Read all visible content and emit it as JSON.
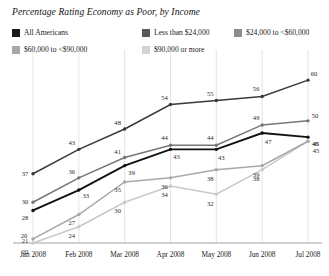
{
  "chart_data": {
    "type": "line",
    "title": "Percentage Rating Economy as Poor, by Income",
    "xlabel": "",
    "ylabel": "",
    "grid": "vertical-only",
    "legend_position": "top",
    "categories": [
      "Jan 2008",
      "Feb 2008",
      "Mar 2008",
      "Apr 2008",
      "May 2008",
      "Jun 2008",
      "Jul 2008"
    ],
    "ylim": [
      20,
      62
    ],
    "y_axis_tick_labels": [
      "20"
    ],
    "series": [
      {
        "name": "$90,000 or more",
        "color": "#3a3a3a",
        "values": [
          37,
          43,
          48,
          54,
          55,
          56,
          60
        ],
        "labels": [
          "37",
          "43",
          "48",
          "54",
          "55",
          "56",
          "60"
        ]
      },
      {
        "name": "$24,000 to <$60,000",
        "color": "#767676",
        "values": [
          30,
          36,
          41,
          44,
          44,
          49,
          50
        ],
        "labels": [
          "30",
          "36",
          "41",
          "44",
          "44",
          "49",
          "50"
        ]
      },
      {
        "name": "All Americans",
        "color": "#111111",
        "values": [
          28,
          33,
          39,
          43,
          43,
          47,
          46
        ],
        "labels": [
          "28",
          "33",
          "39",
          "43",
          "43",
          "47",
          "46"
        ]
      },
      {
        "name": "Less than $24,000",
        "color": "#a8a8a8",
        "values": [
          21,
          27,
          35,
          36,
          38,
          39,
          45
        ],
        "labels": [
          "21",
          "27",
          "35",
          "36",
          "38",
          "39",
          "45"
        ]
      },
      {
        "name": "$60,000 to <$90,000",
        "color": "#c9c9c9",
        "values": [
          20,
          24,
          30,
          34,
          32,
          38,
          45
        ],
        "labels": [
          "20",
          "24",
          "30",
          "34",
          "32",
          "38",
          "45"
        ]
      }
    ]
  },
  "legend": {
    "items": [
      {
        "label": "All Americans",
        "color": "#1a1a1a"
      },
      {
        "label": "Less than $24,000",
        "color": "#595959"
      },
      {
        "label": "$24,000 to <$60,000",
        "color": "#8c8c8c"
      },
      {
        "label": "$60,000 to <$90,000",
        "color": "#a8a8a8"
      },
      {
        "label": "$90,000 or more",
        "color": "#d4d4d4"
      }
    ]
  },
  "axis": {
    "y_min_label": "20"
  }
}
